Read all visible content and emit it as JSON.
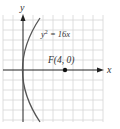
{
  "diagram": {
    "type": "parabola-graph",
    "equation_label": "y² = 16x",
    "equation_base": "y",
    "equation_exp": "2",
    "equation_rest": " = 16x",
    "focus_label": "F(4, 0)",
    "x_axis_label": "x",
    "y_axis_label": "y",
    "focus": {
      "x": 4,
      "y": 0
    },
    "colors": {
      "grid": "#d4d4d4",
      "axis": "#222222",
      "curve": "#555555",
      "point": "#111111",
      "label": "#333333"
    }
  }
}
